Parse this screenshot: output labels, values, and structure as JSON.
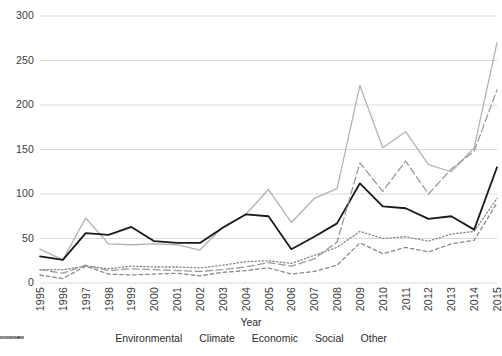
{
  "chart_data": {
    "type": "line",
    "title": "",
    "xlabel": "Year",
    "ylabel": "",
    "grid": true,
    "legend_position": "bottom",
    "xlim": [
      1995,
      2015
    ],
    "ylim": [
      0,
      300
    ],
    "yticks": [
      0,
      50,
      100,
      150,
      200,
      250,
      300
    ],
    "categories": [
      "1995",
      "1996",
      "1997",
      "1998",
      "1999",
      "2000",
      "2001",
      "2002",
      "2003",
      "2004",
      "2005",
      "2006",
      "2007",
      "2008",
      "2009",
      "2010",
      "2011",
      "2012",
      "2013",
      "2014",
      "2015"
    ],
    "x": [
      1995,
      1996,
      1997,
      1998,
      1999,
      2000,
      2001,
      2002,
      2003,
      2004,
      2005,
      2006,
      2007,
      2008,
      2009,
      2010,
      2011,
      2012,
      2013,
      2014,
      2015
    ],
    "series": [
      {
        "name": "Environmental",
        "color": "#b3b3b3",
        "style": "solid",
        "values": [
          38,
          26,
          73,
          44,
          43,
          44,
          43,
          37,
          63,
          77,
          105,
          68,
          95,
          106,
          222,
          152,
          170,
          133,
          125,
          152,
          270
        ]
      },
      {
        "name": "Climate",
        "color": "#8a8a8a",
        "style": "dotted",
        "values": [
          15,
          15,
          19,
          16,
          19,
          18,
          18,
          17,
          20,
          24,
          25,
          22,
          31,
          40,
          58,
          50,
          52,
          47,
          55,
          58,
          95
        ]
      },
      {
        "name": "Economic",
        "color": "#1a1a1a",
        "style": "solid",
        "values": [
          30,
          26,
          56,
          54,
          63,
          47,
          45,
          45,
          62,
          77,
          75,
          38,
          52,
          67,
          112,
          86,
          84,
          72,
          75,
          60,
          130
        ]
      },
      {
        "name": "Social",
        "color": "#9a9a9a",
        "style": "dashed-long",
        "values": [
          15,
          11,
          20,
          14,
          16,
          15,
          14,
          13,
          15,
          18,
          23,
          19,
          27,
          46,
          135,
          103,
          137,
          100,
          128,
          148,
          217
        ]
      },
      {
        "name": "Other",
        "color": "#8a8a8a",
        "style": "dashed-short",
        "values": [
          9,
          5,
          19,
          10,
          9,
          10,
          11,
          8,
          12,
          14,
          17,
          10,
          13,
          20,
          45,
          33,
          40,
          35,
          44,
          48,
          90
        ]
      }
    ]
  },
  "axis": {
    "x_title": "Year",
    "y_ticks": [
      "0",
      "50",
      "100",
      "150",
      "200",
      "250",
      "300"
    ],
    "x_ticks": [
      "1995",
      "1996",
      "1997",
      "1998",
      "1999",
      "2000",
      "2001",
      "2002",
      "2003",
      "2004",
      "2005",
      "2006",
      "2007",
      "2008",
      "2009",
      "2010",
      "2011",
      "2012",
      "2013",
      "2014",
      "2015"
    ]
  },
  "legend": {
    "items": [
      {
        "label": "Environmental"
      },
      {
        "label": "Climate"
      },
      {
        "label": "Economic"
      },
      {
        "label": "Social"
      },
      {
        "label": "Other"
      }
    ]
  }
}
